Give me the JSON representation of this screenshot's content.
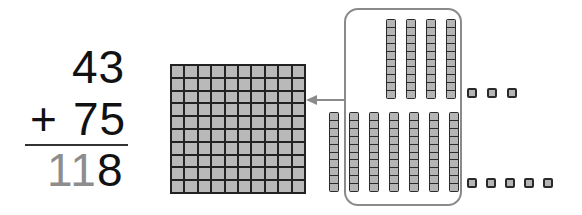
{
  "problem": {
    "addend1": "43",
    "operator": "+",
    "addend2": "75",
    "sum_regrouped": "11",
    "sum_ones": "8",
    "sum_full": "118"
  },
  "blocks": {
    "hundreds_flats": 1,
    "tens_rods_top": 4,
    "tens_rods_bottom": 7,
    "tens_rods_in_frame": 10,
    "ones_cubes_top": 3,
    "ones_cubes_bottom": 5,
    "regroup_arrow": "left-arrow"
  },
  "colors": {
    "block_fill": "#b5b5b5",
    "block_outline": "#2a2a2a",
    "frame": "#8a8a8a",
    "gray_digits": "#8d8d8d"
  }
}
